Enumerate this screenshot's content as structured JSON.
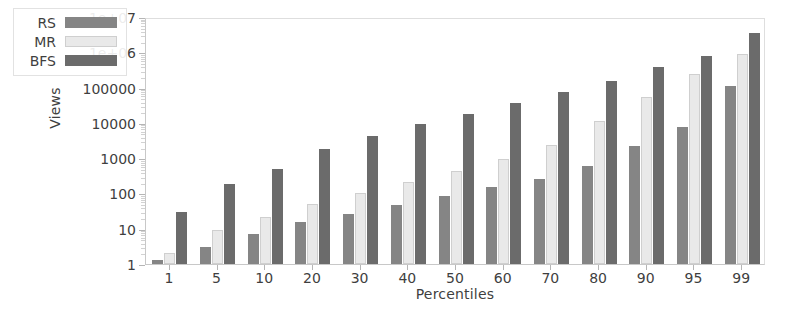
{
  "chart_data": {
    "type": "bar",
    "title": "",
    "xlabel": "Percentiles",
    "ylabel": "Views",
    "yscale": "log",
    "ylim": [
      1,
      10000000
    ],
    "ytick_labels": [
      "1",
      "10",
      "100",
      "1000",
      "10000",
      "100000",
      "1e+06",
      "1e+07"
    ],
    "ytick_values": [
      1,
      10,
      100,
      1000,
      10000,
      100000,
      1000000,
      10000000
    ],
    "grid": false,
    "legend_position": "upper-left",
    "categories": [
      "1",
      "5",
      "10",
      "20",
      "30",
      "40",
      "50",
      "60",
      "70",
      "80",
      "90",
      "95",
      "99"
    ],
    "series": [
      {
        "name": "RS",
        "color": "#858585",
        "values": [
          1.3,
          3,
          7,
          16,
          27,
          48,
          82,
          150,
          260,
          600,
          2200,
          7500,
          110000
        ]
      },
      {
        "name": "MR",
        "color": "#e9e9e9",
        "values": [
          2,
          9,
          22,
          50,
          100,
          210,
          430,
          950,
          2400,
          11000,
          55000,
          250000,
          900000
        ]
      },
      {
        "name": "BFS",
        "color": "#6b6b6b",
        "values": [
          30,
          190,
          480,
          1800,
          4300,
          9000,
          18000,
          37000,
          75000,
          150000,
          380000,
          800000,
          3500000
        ]
      }
    ]
  },
  "legend": {
    "entries": [
      {
        "label": "RS",
        "swatch": "rs"
      },
      {
        "label": "MR",
        "swatch": "mr"
      },
      {
        "label": "BFS",
        "swatch": "bfs"
      }
    ]
  },
  "colors": {
    "rs": "#858585",
    "mr": "#e9e9e9",
    "bfs": "#6b6b6b",
    "axis": "#c8c8c8",
    "text": "#3f3f3f"
  }
}
